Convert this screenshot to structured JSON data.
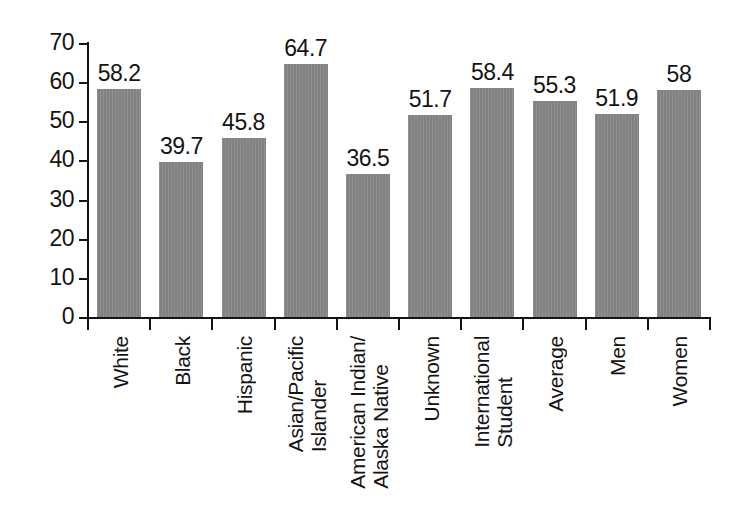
{
  "chart_data": {
    "type": "bar",
    "title": "",
    "subtitle": "",
    "xlabel": "",
    "ylabel": "",
    "ylim": [
      0,
      70
    ],
    "ytick_step": 10,
    "yticks": [
      "70",
      "60",
      "50",
      "40",
      "30",
      "20",
      "10",
      "0"
    ],
    "grid": false,
    "legend": false,
    "bar_color": "#888888",
    "axis_color": "#141414",
    "text_color": "#141414",
    "categories": [
      "White",
      "Black",
      "Hispanic",
      "Asian/Pacific Islander",
      "American Indian/Alaska Native",
      "Unknown",
      "International Student",
      "Average",
      "Men",
      "Women"
    ],
    "category_lines": [
      [
        "White"
      ],
      [
        "Black"
      ],
      [
        "Hispanic"
      ],
      [
        "Asian/Pacific",
        "Islander"
      ],
      [
        "American Indian/",
        "Alaska Native"
      ],
      [
        "Unknown"
      ],
      [
        "International",
        "Student"
      ],
      [
        "Average"
      ],
      [
        "Men"
      ],
      [
        "Women"
      ]
    ],
    "values": [
      58.2,
      39.7,
      45.8,
      64.7,
      36.5,
      51.7,
      58.4,
      55.3,
      51.9,
      58
    ],
    "value_labels": [
      "58.2",
      "39.7",
      "45.8",
      "64.7",
      "36.5",
      "51.7",
      "58.4",
      "55.3",
      "51.9",
      "58"
    ]
  }
}
